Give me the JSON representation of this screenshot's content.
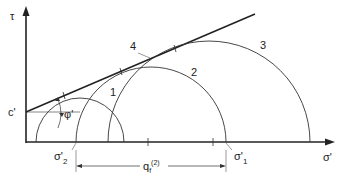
{
  "diagram": {
    "axes": {
      "y_label": "τ",
      "x_label": "σ'"
    },
    "labels": {
      "cohesion": "c'",
      "friction_angle": "φ'",
      "sigma2": "σ'",
      "sigma2_sub": "2",
      "sigma1": "σ'",
      "sigma1_sub": "1",
      "qf": "q",
      "qf_sub": "f",
      "qf_sup": "(2)"
    },
    "circles": [
      {
        "id": "1",
        "label": "1"
      },
      {
        "id": "2",
        "label": "2"
      },
      {
        "id": "3",
        "label": "3"
      }
    ],
    "envelope_label": "4",
    "colors": {
      "line": "#222222",
      "circle": "#333333"
    }
  }
}
